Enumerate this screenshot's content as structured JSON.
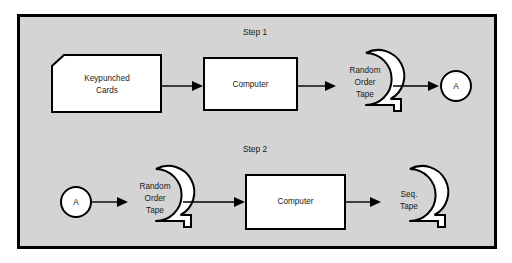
{
  "figure": {
    "panel_background": "#d4d4d4",
    "panel_border_color": "#000000",
    "shape_fill": "#ffffff",
    "shape_stroke": "#000000",
    "page_background": "#ffffff"
  },
  "steps": [
    {
      "label": "Step 1",
      "nodes": [
        {
          "id": "keypunched-cards",
          "type": "punched-card",
          "text": "Keypunched\nCards",
          "line1": "Keypunched",
          "line2": "Cards"
        },
        {
          "id": "computer-1",
          "type": "process",
          "text": "Computer",
          "line1": "Computer"
        },
        {
          "id": "random-order-tape-1",
          "type": "tape",
          "text": "Random\nOrder\nTape",
          "line1": "Random",
          "line2": "Order",
          "line3": "Tape"
        },
        {
          "id": "connector-a-out",
          "type": "connector",
          "text": "A",
          "line1": "A"
        }
      ],
      "arrows": [
        {
          "from": "keypunched-cards",
          "to": "computer-1"
        },
        {
          "from": "computer-1",
          "to": "random-order-tape-1"
        },
        {
          "from": "random-order-tape-1",
          "to": "connector-a-out"
        }
      ]
    },
    {
      "label": "Step 2",
      "nodes": [
        {
          "id": "connector-a-in",
          "type": "connector",
          "text": "A",
          "line1": "A"
        },
        {
          "id": "random-order-tape-2",
          "type": "tape",
          "text": "Random\nOrder\nTape",
          "line1": "Random",
          "line2": "Order",
          "line3": "Tape"
        },
        {
          "id": "computer-2",
          "type": "process",
          "text": "Computer",
          "line1": "Computer"
        },
        {
          "id": "seq-tape",
          "type": "tape",
          "text": "Seq.\nTape",
          "line1": "Seq.",
          "line2": "Tape"
        }
      ],
      "arrows": [
        {
          "from": "connector-a-in",
          "to": "random-order-tape-2"
        },
        {
          "from": "random-order-tape-2",
          "to": "computer-2"
        },
        {
          "from": "computer-2",
          "to": "seq-tape"
        }
      ]
    }
  ]
}
